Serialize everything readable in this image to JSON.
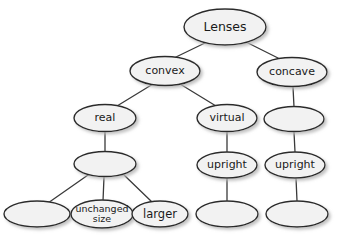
{
  "diagram": {
    "type": "tree",
    "style": {
      "node_fill": "#f2f2f2",
      "node_stroke": "#2b2b2b",
      "edge_color": "#3a3a3a",
      "text_color": "#1a1a1a",
      "shadow_color": "#c8c8c8",
      "background": "#ffffff"
    },
    "nodes": [
      {
        "id": "lenses",
        "label": "Lenses",
        "cx": 225,
        "cy": 27,
        "rx": 41,
        "ry": 18,
        "font_size": 12.5,
        "lines": [
          "Lenses"
        ]
      },
      {
        "id": "convex",
        "label": "convex",
        "cx": 165,
        "cy": 71,
        "rx": 35,
        "ry": 14.5,
        "font_size": 11,
        "lines": [
          "convex"
        ]
      },
      {
        "id": "concave",
        "label": "concave",
        "cx": 292,
        "cy": 72,
        "rx": 35,
        "ry": 14.5,
        "font_size": 11,
        "lines": [
          "concave"
        ]
      },
      {
        "id": "real",
        "label": "real",
        "cx": 105,
        "cy": 118,
        "rx": 31,
        "ry": 13.5,
        "font_size": 11,
        "lines": [
          "real"
        ]
      },
      {
        "id": "virtual",
        "label": "virtual",
        "cx": 227,
        "cy": 118,
        "rx": 30,
        "ry": 13.5,
        "font_size": 11,
        "lines": [
          "virtual"
        ]
      },
      {
        "id": "concave-blank-1",
        "label": "",
        "cx": 294,
        "cy": 119,
        "rx": 30,
        "ry": 12.5,
        "font_size": 11,
        "lines": []
      },
      {
        "id": "real-blank-1",
        "label": "",
        "cx": 105,
        "cy": 164,
        "rx": 31,
        "ry": 12.5,
        "font_size": 11,
        "lines": []
      },
      {
        "id": "upright-virtual",
        "label": "upright",
        "cx": 227,
        "cy": 165,
        "rx": 30,
        "ry": 13,
        "font_size": 11,
        "lines": [
          "upright"
        ]
      },
      {
        "id": "upright-concave",
        "label": "upright",
        "cx": 295,
        "cy": 165,
        "rx": 30,
        "ry": 13,
        "font_size": 11,
        "lines": [
          "upright"
        ]
      },
      {
        "id": "real-blank-2",
        "label": "",
        "cx": 37,
        "cy": 214,
        "rx": 33,
        "ry": 13,
        "font_size": 11,
        "lines": []
      },
      {
        "id": "unchanged-size",
        "label": "unchanged size",
        "cx": 102,
        "cy": 214,
        "rx": 31,
        "ry": 14,
        "font_size": 9.5,
        "lines": [
          "unchanged",
          "size"
        ]
      },
      {
        "id": "larger",
        "label": "larger",
        "cx": 160,
        "cy": 214,
        "rx": 28,
        "ry": 13,
        "font_size": 11.5,
        "lines": [
          "larger"
        ]
      },
      {
        "id": "virtual-blank",
        "label": "",
        "cx": 227,
        "cy": 214,
        "rx": 31,
        "ry": 13,
        "font_size": 11,
        "lines": []
      },
      {
        "id": "concave-blank-2",
        "label": "",
        "cx": 297,
        "cy": 214,
        "rx": 31,
        "ry": 13,
        "font_size": 11,
        "lines": []
      }
    ],
    "edges": [
      {
        "id": "lenses-convex",
        "from": "lenses",
        "to": "convex",
        "x1": 207,
        "y1": 42,
        "x2": 176,
        "y2": 57
      },
      {
        "id": "lenses-concave",
        "from": "lenses",
        "to": "concave",
        "x1": 246,
        "y1": 42,
        "x2": 278,
        "y2": 58
      },
      {
        "id": "convex-real",
        "from": "convex",
        "to": "real",
        "x1": 153,
        "y1": 84,
        "x2": 117,
        "y2": 106
      },
      {
        "id": "convex-virtual",
        "from": "convex",
        "to": "virtual",
        "x1": 180,
        "y1": 84,
        "x2": 216,
        "y2": 106
      },
      {
        "id": "concave-blank1",
        "from": "concave",
        "to": "concave-blank-1",
        "x1": 293,
        "y1": 87,
        "x2": 294,
        "y2": 107
      },
      {
        "id": "real-blank1",
        "from": "real",
        "to": "real-blank-1",
        "x1": 105,
        "y1": 132,
        "x2": 105,
        "y2": 152
      },
      {
        "id": "virtual-upright",
        "from": "virtual",
        "to": "upright-virtual",
        "x1": 227,
        "y1": 132,
        "x2": 227,
        "y2": 152
      },
      {
        "id": "blank1-upright",
        "from": "concave-blank-1",
        "to": "upright-concave",
        "x1": 294,
        "y1": 132,
        "x2": 295,
        "y2": 152
      },
      {
        "id": "blank1-blank2",
        "from": "real-blank-1",
        "to": "real-blank-2",
        "x1": 88,
        "y1": 175,
        "x2": 48,
        "y2": 203
      },
      {
        "id": "blank1-unchanged",
        "from": "real-blank-1",
        "to": "unchanged-size",
        "x1": 104,
        "y1": 177,
        "x2": 103,
        "y2": 201
      },
      {
        "id": "blank1-larger",
        "from": "real-blank-1",
        "to": "larger",
        "x1": 124,
        "y1": 175,
        "x2": 152,
        "y2": 202
      },
      {
        "id": "upright-vblank",
        "from": "upright-virtual",
        "to": "virtual-blank",
        "x1": 227,
        "y1": 178,
        "x2": 227,
        "y2": 201
      },
      {
        "id": "upright-cblank",
        "from": "upright-concave",
        "to": "concave-blank-2",
        "x1": 296,
        "y1": 178,
        "x2": 297,
        "y2": 201
      }
    ]
  }
}
